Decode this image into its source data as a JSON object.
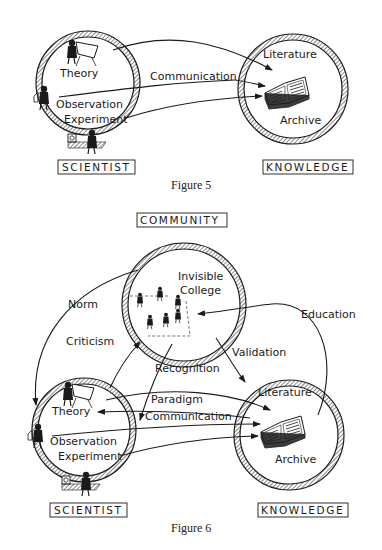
{
  "figures": [
    {
      "caption": "Figure 5",
      "nodes": {
        "scientist": {
          "label": "SCIENTIST",
          "items": [
            "Theory",
            "Observation",
            "Experiment"
          ]
        },
        "knowledge": {
          "label": "KNOWLEDGE",
          "items": [
            "Literature",
            "Archive"
          ]
        }
      },
      "edges": [
        {
          "from": "Theory",
          "to": "Literature",
          "label": ""
        },
        {
          "from": "Observation",
          "to": "Archive",
          "label": "Communication"
        },
        {
          "from": "Experiment",
          "to": "Archive",
          "label": ""
        }
      ]
    },
    {
      "caption": "Figure 6",
      "nodes": {
        "community": {
          "label": "COMMUNITY",
          "items": [
            "Invisible",
            "College"
          ]
        },
        "scientist": {
          "label": "SCIENTIST",
          "items": [
            "Theory",
            "Observation",
            "Experiment"
          ]
        },
        "knowledge": {
          "label": "KNOWLEDGE",
          "items": [
            "Literature",
            "Archive"
          ]
        }
      },
      "edges": [
        {
          "from": "community",
          "to": "scientist",
          "label": "Norm"
        },
        {
          "from": "scientist",
          "to": "community",
          "label": "Criticism"
        },
        {
          "from": "community",
          "to": "scientist",
          "label": "Recognition"
        },
        {
          "from": "community",
          "to": "knowledge",
          "label": "Validation"
        },
        {
          "from": "knowledge",
          "to": "community",
          "label": "Education"
        },
        {
          "from": "knowledge",
          "to": "Theory",
          "label": "Paradigm"
        },
        {
          "from": "Observation",
          "to": "Archive",
          "label": "Communication"
        },
        {
          "from": "Theory",
          "to": "Literature",
          "label": ""
        },
        {
          "from": "Experiment",
          "to": "Archive",
          "label": ""
        }
      ]
    }
  ]
}
